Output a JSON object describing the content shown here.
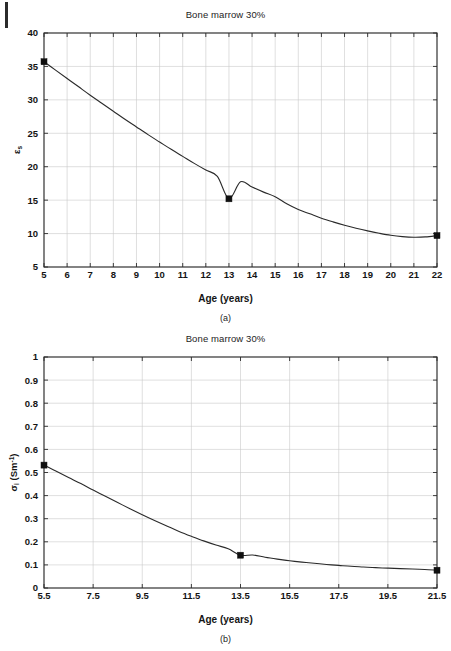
{
  "page": {
    "background_color": "#ffffff",
    "ink_color": "#2a2a2a",
    "grid_color": "#c9c9c9",
    "edge_mark": "page-edge-bar"
  },
  "figures": [
    {
      "id": "a",
      "caption": "(a)",
      "title": "Bone marrow 30%",
      "xlabel": "Age (years)",
      "ylabel_symbol": "ε",
      "ylabel_subscript": "s",
      "ylabel_text": "εs"
    },
    {
      "id": "b",
      "caption": "(b)",
      "title": "Bone marrow 30%",
      "xlabel": "Age (years)",
      "ylabel_symbol": "σ",
      "ylabel_subscript": "i",
      "ylabel_unit": "(Sm",
      "ylabel_unit_sup": "-1",
      "ylabel_unit_close": ")",
      "ylabel_text": "σi (Sm-1)"
    }
  ],
  "chart_data": [
    {
      "type": "line",
      "id": "a",
      "title": "Bone marrow 30%",
      "xlabel": "Age (years)",
      "ylabel": "εs",
      "xlim": [
        5,
        22
      ],
      "ylim": [
        5,
        40
      ],
      "xticks": [
        5,
        6,
        7,
        8,
        9,
        10,
        11,
        12,
        13,
        14,
        15,
        16,
        17,
        18,
        19,
        20,
        21,
        22
      ],
      "xticklabels": [
        "5",
        "6",
        "7",
        "8",
        "9",
        "10",
        "11",
        "12",
        "13",
        "14",
        "15",
        "16",
        "17",
        "18",
        "19",
        "20",
        "21",
        "22"
      ],
      "yticks": [
        5,
        10,
        15,
        20,
        25,
        30,
        35,
        40
      ],
      "yticklabels": [
        "5",
        "10",
        "15",
        "20",
        "25",
        "30",
        "35",
        "40"
      ],
      "grid": true,
      "legend": "none",
      "series": [
        {
          "name": "fitted curve",
          "marker": "none",
          "x": [
            5,
            5.5,
            6,
            6.5,
            7,
            7.5,
            8,
            8.5,
            9,
            9.5,
            10,
            10.5,
            11,
            11.5,
            12,
            12.5,
            13,
            13.5,
            14,
            14.5,
            15,
            15.5,
            16,
            16.5,
            17,
            17.5,
            18,
            18.5,
            19,
            19.5,
            20,
            20.5,
            21,
            21.5,
            22
          ],
          "y": [
            35.7,
            34.45,
            33.2,
            31.95,
            30.7,
            29.5,
            28.3,
            27.1,
            25.95,
            24.8,
            23.7,
            22.6,
            21.55,
            20.5,
            19.5,
            18.55,
            15.2,
            17.75,
            16.95,
            16.2,
            15.5,
            14.45,
            13.6,
            12.95,
            12.3,
            11.75,
            11.25,
            10.8,
            10.4,
            10.05,
            9.75,
            9.55,
            9.45,
            9.5,
            9.7
          ]
        },
        {
          "name": "data points",
          "marker": "square",
          "x": [
            5,
            13,
            22
          ],
          "y": [
            35.7,
            15.2,
            9.7
          ]
        }
      ]
    },
    {
      "type": "line",
      "id": "b",
      "title": "Bone marrow 30%",
      "xlabel": "Age (years)",
      "ylabel": "σi (Sm-1)",
      "xlim": [
        5.5,
        21.5
      ],
      "ylim": [
        0,
        1
      ],
      "xticks": [
        5.5,
        7.5,
        9.5,
        11.5,
        13.5,
        15.5,
        17.5,
        19.5,
        21.5
      ],
      "xticklabels": [
        "5.5",
        "7.5",
        "9.5",
        "11.5",
        "13.5",
        "15.5",
        "17.5",
        "19.5",
        "21.5"
      ],
      "yticks": [
        0,
        0.1,
        0.2,
        0.3,
        0.4,
        0.5,
        0.6,
        0.7,
        0.8,
        0.9,
        1
      ],
      "yticklabels": [
        "0",
        "0.1",
        "0.2",
        "0.3",
        "0.4",
        "0.5",
        "0.6",
        "0.7",
        "0.8",
        "0.9",
        "1"
      ],
      "grid": true,
      "legend": "none",
      "series": [
        {
          "name": "fitted curve",
          "marker": "none",
          "x": [
            5.5,
            6,
            6.5,
            7,
            7.5,
            8,
            8.5,
            9,
            9.5,
            10,
            10.5,
            11,
            11.5,
            12,
            12.5,
            13,
            13.5,
            14,
            14.5,
            15,
            15.5,
            16,
            16.5,
            17,
            17.5,
            18,
            18.5,
            19,
            19.5,
            20,
            20.5,
            21,
            21.5
          ],
          "y": [
            0.532,
            0.505,
            0.478,
            0.452,
            0.424,
            0.397,
            0.37,
            0.343,
            0.317,
            0.292,
            0.268,
            0.245,
            0.224,
            0.204,
            0.186,
            0.17,
            0.142,
            0.143,
            0.133,
            0.125,
            0.118,
            0.112,
            0.107,
            0.102,
            0.098,
            0.094,
            0.091,
            0.088,
            0.086,
            0.084,
            0.082,
            0.08,
            0.077
          ]
        },
        {
          "name": "data points",
          "marker": "square",
          "x": [
            5.5,
            13.5,
            21.5
          ],
          "y": [
            0.532,
            0.142,
            0.077
          ]
        }
      ]
    }
  ]
}
